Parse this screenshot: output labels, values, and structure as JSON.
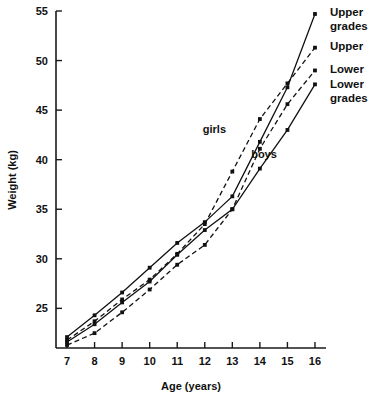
{
  "chart_data": {
    "type": "line",
    "title": "",
    "xlabel": "Age (years)",
    "ylabel": "Weight (kg)",
    "xlim": [
      6.6,
      16.4
    ],
    "ylim": [
      21.0,
      55.0
    ],
    "xticks": [
      7,
      8,
      9,
      10,
      11,
      12,
      13,
      14,
      15,
      16
    ],
    "xtick_labels": [
      "7",
      "8",
      "9",
      "10",
      "11",
      "12",
      "13",
      "14",
      "15",
      "16"
    ],
    "yticks": [
      25,
      30,
      35,
      40,
      45,
      50,
      55
    ],
    "ytick_labels": [
      "25",
      "30",
      "35",
      "40",
      "45",
      "50",
      "55"
    ],
    "grid": false,
    "legend_position": "right-inline-labels",
    "x": [
      7,
      8,
      9,
      10,
      11,
      12,
      13,
      14,
      15,
      16
    ],
    "series": [
      {
        "name": "Upper grades",
        "group": "boys",
        "style": "solid",
        "label": "Upper",
        "label_line2": "grades",
        "values": [
          22.1,
          24.3,
          26.6,
          29.1,
          31.6,
          33.7,
          36.3,
          41.8,
          47.3,
          54.7
        ]
      },
      {
        "name": "Upper",
        "group": "girls",
        "style": "dashed",
        "label": "Upper",
        "label_line2": "",
        "values": [
          21.8,
          23.7,
          25.9,
          27.9,
          30.5,
          33.5,
          38.8,
          44.1,
          47.7,
          51.3
        ]
      },
      {
        "name": "Lower",
        "group": "girls",
        "style": "dashed",
        "label": "Lower",
        "label_line2": "",
        "values": [
          21.3,
          22.5,
          24.6,
          26.9,
          29.4,
          31.4,
          35.0,
          41.1,
          45.6,
          49.0
        ]
      },
      {
        "name": "Lower grades",
        "group": "boys",
        "style": "solid",
        "label": "Lower",
        "label_line2": "grades",
        "values": [
          21.6,
          23.4,
          25.6,
          27.7,
          30.4,
          32.9,
          35.0,
          39.1,
          43.0,
          47.6
        ]
      }
    ],
    "annotations": [
      {
        "text": "girls",
        "x": 12.35,
        "y": 42.7
      },
      {
        "text": "boys",
        "x": 14.15,
        "y": 40.2
      }
    ],
    "colors": {
      "ink": "#111111",
      "background": "#ffffff"
    }
  }
}
